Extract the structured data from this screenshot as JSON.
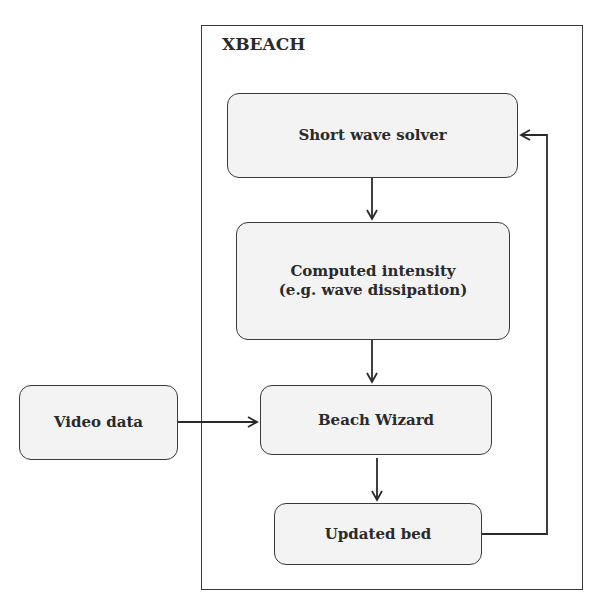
{
  "diagram": {
    "container": {
      "label": "XBEACH"
    },
    "nodes": [
      {
        "id": "short_wave_solver",
        "label": "Short wave solver"
      },
      {
        "id": "computed_intensity",
        "label": "Computed intensity\n(e.g. wave dissipation)",
        "line1": "Computed intensity",
        "line2": "(e.g. wave dissipation)"
      },
      {
        "id": "beach_wizard",
        "label": "Beach Wizard"
      },
      {
        "id": "updated_bed",
        "label": "Updated bed"
      },
      {
        "id": "video_data",
        "label": "Video data"
      }
    ],
    "edges": [
      {
        "from": "short_wave_solver",
        "to": "computed_intensity"
      },
      {
        "from": "computed_intensity",
        "to": "beach_wizard"
      },
      {
        "from": "video_data",
        "to": "beach_wizard"
      },
      {
        "from": "beach_wizard",
        "to": "updated_bed"
      },
      {
        "from": "updated_bed",
        "to": "short_wave_solver"
      }
    ]
  }
}
